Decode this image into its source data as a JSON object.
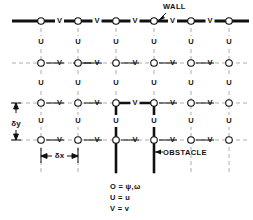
{
  "figure": {
    "kind": "staggered-grid-diagram",
    "width": 253,
    "height": 220,
    "background": "#ffffff",
    "ink": "#111111",
    "grid_color": "#999999"
  },
  "annotations": {
    "wall": "WALL",
    "obstacle": "OBSTACLE"
  },
  "dimensions": {
    "dy": "δy",
    "dx": "δx"
  },
  "node_labels": {
    "o": "O",
    "u": "U",
    "v": "V"
  },
  "legend": {
    "items": [
      {
        "symbol": "O",
        "equals": "=",
        "meaning": "ψ,ω"
      },
      {
        "symbol": "U",
        "equals": "=",
        "meaning": "u"
      },
      {
        "symbol": "V",
        "equals": "=",
        "meaning": "v"
      }
    ],
    "line1": "O = ψ,ω",
    "line2": "U = u",
    "line3": "V = v"
  },
  "grid": {
    "columns_x": [
      41,
      78,
      116,
      154,
      191,
      229
    ],
    "rows_y": [
      21,
      63,
      103,
      140
    ],
    "u_rows_y": [
      42,
      83,
      121
    ],
    "cell_dx": 37.5,
    "cell_dy": 38,
    "left_extent": 12,
    "right_extent": 249,
    "bottom_extent": 172
  },
  "obstacle_geometry": {
    "top_y": 103,
    "left_x": 116,
    "right_x": 154,
    "bottom_y": 172,
    "stroke_width": 2.6
  },
  "wall_geometry": {
    "y": 21,
    "x_start": 12,
    "x_end": 249,
    "stroke_width": 3.2
  }
}
